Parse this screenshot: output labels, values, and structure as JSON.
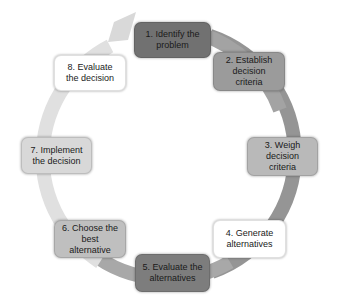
{
  "diagram": {
    "type": "cycle",
    "ring_colors": {
      "arrow_head": "#d8d8d8",
      "top_right": "#a0a0a0",
      "right": "#7c7c7c",
      "bottom": "#9a9a9a",
      "left": "#dedede"
    },
    "steps": [
      {
        "id": 1,
        "label": "1. Identify the problem",
        "fill": "#717171"
      },
      {
        "id": 2,
        "label": "2. Establish decision criteria",
        "fill": "#9b9b9b"
      },
      {
        "id": 3,
        "label": "3. Weigh decision criteria",
        "fill": "#b9b9b9"
      },
      {
        "id": 4,
        "label": "4. Generate alternatives",
        "fill": "#ffffff"
      },
      {
        "id": 5,
        "label": "5. Evaluate the alternatives",
        "fill": "#7d7d7d"
      },
      {
        "id": 6,
        "label": "6. Choose the best alternative",
        "fill": "#bfbfbf"
      },
      {
        "id": 7,
        "label": "7. Implement the decision",
        "fill": "#d8d8d8"
      },
      {
        "id": 8,
        "label": "8. Evaluate the decision",
        "fill": "#ffffff"
      }
    ]
  }
}
